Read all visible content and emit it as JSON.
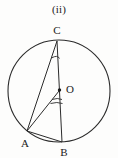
{
  "figure": {
    "caption": "(ii)",
    "stroke_color": "#2b2b2b",
    "background_color": "#fdfdfc",
    "label_color": "#1a1a1a"
  },
  "circle": {
    "center_label": "O",
    "center": {
      "x": 59,
      "y": 91
    },
    "radius": 51,
    "stroke_width": 1.1
  },
  "points": [
    {
      "id": "C",
      "label": "C",
      "x": 57,
      "y": 41,
      "label_x": 57,
      "label_y": 34
    },
    {
      "id": "A",
      "label": "A",
      "x": 27,
      "y": 131,
      "label_x": 25,
      "label_y": 146
    },
    {
      "id": "B",
      "label": "B",
      "x": 62,
      "y": 142,
      "label_x": 64,
      "label_y": 155
    },
    {
      "id": "O",
      "label": "O",
      "x": 59,
      "y": 91,
      "label_x": 68,
      "label_y": 92
    }
  ],
  "segments": [
    {
      "id": "AC",
      "from": "A",
      "to": "C",
      "name": "chord-a-c"
    },
    {
      "id": "AO",
      "from": "A",
      "to": "O",
      "name": "radius-a-o"
    },
    {
      "id": "AB",
      "from": "A",
      "to": "B",
      "name": "chord-a-b"
    },
    {
      "id": "CB",
      "from": "C",
      "to": "B",
      "name": "chord-c-b-through-center"
    }
  ],
  "angle_marks": [
    {
      "id": "angle-C",
      "vertex": "C",
      "arcs": 1,
      "name": "inscribed-angle-arc-at-c"
    },
    {
      "id": "angle-O",
      "vertex": "O",
      "arcs": 2,
      "name": "central-angle-double-arc-at-o"
    }
  ]
}
